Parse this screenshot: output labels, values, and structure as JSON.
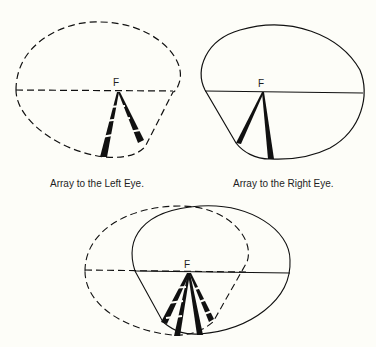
{
  "figures": [
    {
      "id": "left-eye",
      "caption": "Array to the Left Eye.",
      "fixation_label": "F",
      "outline_style": "dashed",
      "ray_style": "dashed"
    },
    {
      "id": "right-eye",
      "caption": "Array to the Right Eye.",
      "fixation_label": "F",
      "outline_style": "solid",
      "ray_style": "solid"
    },
    {
      "id": "combined",
      "caption": "",
      "fixation_label": "F",
      "outline_style": "dashed+solid",
      "ray_style": "dashed+solid"
    }
  ],
  "colors": {
    "ink": "#111111",
    "background": "#fdfdf8"
  }
}
